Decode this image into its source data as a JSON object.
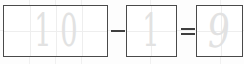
{
  "worksheet": {
    "kind": "handwriting-practice-equation",
    "equation_text": "10 - 1 = 9",
    "ink_color": "#e2e2e2",
    "box_border_color": "#4a4a4a",
    "grid_color": "#eeeeee",
    "background_color": "#fdfdfd",
    "boxes": [
      {
        "name": "first-operand-box",
        "value": "10",
        "digits": [
          {
            "char": "1",
            "style": "tall"
          },
          {
            "char": "0",
            "style": "tall"
          }
        ]
      },
      {
        "name": "second-operand-box",
        "value": "1",
        "digits": [
          {
            "char": "1",
            "style": "tall"
          }
        ]
      },
      {
        "name": "result-box",
        "value": "9",
        "digits": [
          {
            "char": "9",
            "style": "slant"
          }
        ]
      }
    ],
    "operators": [
      {
        "name": "minus-operator",
        "symbol": "-",
        "bars": 1
      },
      {
        "name": "equals-operator",
        "symbol": "=",
        "bars": 2
      }
    ]
  }
}
